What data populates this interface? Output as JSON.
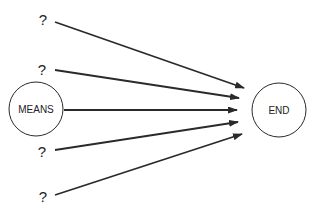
{
  "diagram": {
    "nodes": [
      {
        "id": "means",
        "label": "MEANS",
        "cx": 36,
        "cy": 109,
        "r": 27
      },
      {
        "id": "end",
        "label": "END",
        "cx": 279,
        "cy": 110,
        "r": 27
      }
    ],
    "unknowns": [
      {
        "label": "?",
        "x": 43,
        "y": 25
      },
      {
        "label": "?",
        "x": 42,
        "y": 75
      },
      {
        "label": "?",
        "x": 42,
        "y": 157
      },
      {
        "label": "?",
        "x": 43,
        "y": 202
      }
    ],
    "edges": [
      {
        "from": "?",
        "x1": 55,
        "y1": 22,
        "x2": 244,
        "y2": 88
      },
      {
        "from": "?",
        "x1": 55,
        "y1": 70,
        "x2": 239,
        "y2": 98
      },
      {
        "from": "MEANS",
        "x1": 64,
        "y1": 110,
        "x2": 237,
        "y2": 110
      },
      {
        "from": "?",
        "x1": 55,
        "y1": 150,
        "x2": 238,
        "y2": 122
      },
      {
        "from": "?",
        "x1": 55,
        "y1": 195,
        "x2": 242,
        "y2": 134
      }
    ],
    "colors": {
      "stroke": "#2a2a2a",
      "background": "#ffffff"
    }
  }
}
